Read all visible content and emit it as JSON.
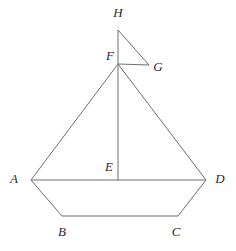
{
  "figure": {
    "name": "sailboat-geometry-diagram",
    "background_color": "#ffffff",
    "line_color": "#6f6f6f",
    "label_color": "#2b2b2b",
    "points": {
      "A": {
        "label": "A",
        "x": 31,
        "y": 180,
        "label_x": 14,
        "label_y": 180
      },
      "B": {
        "label": "B",
        "x": 62,
        "y": 216,
        "label_x": 62,
        "label_y": 233
      },
      "C": {
        "label": "C",
        "x": 178,
        "y": 216,
        "label_x": 176,
        "label_y": 233
      },
      "D": {
        "label": "D",
        "x": 206,
        "y": 180,
        "label_x": 220,
        "label_y": 180
      },
      "E": {
        "label": "E",
        "x": 118,
        "y": 180,
        "label_x": 109,
        "label_y": 168
      },
      "F": {
        "label": "F",
        "x": 118,
        "y": 64,
        "label_x": 110,
        "label_y": 57
      },
      "G": {
        "label": "G",
        "x": 149,
        "y": 65,
        "label_x": 158,
        "label_y": 68
      },
      "H": {
        "label": "H",
        "x": 118,
        "y": 30,
        "label_x": 118,
        "label_y": 14
      }
    },
    "segments": [
      {
        "name": "hull-side-AB",
        "from": "A",
        "to": "B"
      },
      {
        "name": "hull-base-BC",
        "from": "B",
        "to": "C"
      },
      {
        "name": "hull-side-CD",
        "from": "C",
        "to": "D"
      },
      {
        "name": "deck-line-AD",
        "from": "A",
        "to": "D"
      },
      {
        "name": "sail-edge-AF",
        "from": "A",
        "to": "F"
      },
      {
        "name": "sail-edge-FD",
        "from": "F",
        "to": "D"
      },
      {
        "name": "mast-FE",
        "from": "F",
        "to": "E"
      },
      {
        "name": "flag-edge-FH",
        "from": "F",
        "to": "H"
      },
      {
        "name": "flag-edge-HG",
        "from": "H",
        "to": "G"
      },
      {
        "name": "flag-edge-GF",
        "from": "G",
        "to": "F"
      }
    ]
  }
}
